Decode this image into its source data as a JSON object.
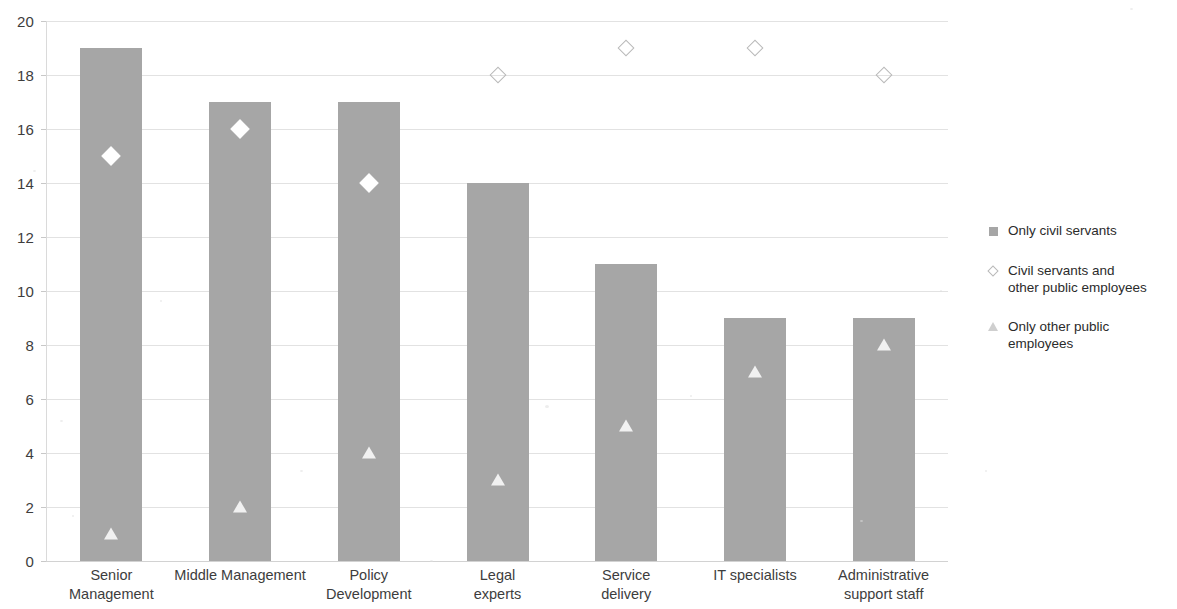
{
  "chart_data": {
    "type": "bar",
    "title": "",
    "subtitle": "",
    "xlabel": "",
    "ylabel": "",
    "ylim": [
      0,
      20
    ],
    "ytick_step": 2,
    "yticks": [
      0,
      2,
      4,
      6,
      8,
      10,
      12,
      14,
      16,
      18,
      20
    ],
    "grid": true,
    "legend_position": "right",
    "categories": [
      "Senior\nManagement",
      "Middle Management",
      "Policy\nDevelopment",
      "Legal\nexperts",
      "Service\ndelivery",
      "IT specialists",
      "Administrative\nsupport staff"
    ],
    "series": [
      {
        "name": "Only civil servants",
        "marker": "square",
        "render": "bar",
        "color": "#a6a6a6",
        "values": [
          19,
          17,
          17,
          14,
          11,
          9,
          9
        ]
      },
      {
        "name": "Civil servants and\nother public employees",
        "marker": "diamond",
        "render": "marker",
        "color": "#ffffff",
        "values": [
          15,
          16,
          14,
          18,
          19,
          19,
          18
        ]
      },
      {
        "name": "Only other public employees",
        "marker": "triangle",
        "render": "marker",
        "color": "#efefef",
        "values": [
          1,
          2,
          4,
          3,
          5,
          7,
          8
        ]
      }
    ]
  },
  "legend": {
    "items": [
      {
        "label": "Only civil servants",
        "swatch": "square-icon"
      },
      {
        "label": "Civil servants and\nother public employees",
        "swatch": "diamond-outline-icon"
      },
      {
        "label": "Only other public employees",
        "swatch": "triangle-icon"
      }
    ]
  },
  "colors": {
    "bar": "#a6a6a6",
    "gridline": "#e2e2e2",
    "axis_text": "#3d3d3d",
    "legend_text": "#2b2b2b",
    "background": "#ffffff"
  }
}
